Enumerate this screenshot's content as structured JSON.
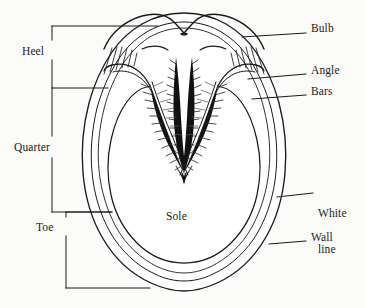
{
  "figure": {
    "background_color": "#fbfbf9",
    "ink_color": "#1b1b1b",
    "orientation": "heel at top, toe at bottom"
  },
  "labels": {
    "bulb": "Bulb",
    "angle": "Angle",
    "bars": "Bars",
    "white_line": "White\nline",
    "white_line_l1": "White",
    "white_line_l2": "line",
    "wall": "Wall",
    "sole": "Sole",
    "heel": "Heel",
    "quarter": "Quarter",
    "toe": "Toe"
  },
  "right_callouts": [
    {
      "name": "bulb",
      "label": "Bulb",
      "text_x": 311,
      "text_y": 29,
      "leader_from_x": 242,
      "leader_from_y": 37,
      "leader_to_x": 306,
      "leader_to_y": 33
    },
    {
      "name": "angle",
      "label": "Angle",
      "text_x": 311,
      "text_y": 70,
      "leader_from_x": 248,
      "leader_from_y": 79,
      "leader_to_x": 306,
      "leader_to_y": 74
    },
    {
      "name": "bars",
      "label": "Bars",
      "text_x": 311,
      "text_y": 91,
      "leader_from_x": 252,
      "leader_from_y": 99,
      "leader_to_x": 306,
      "leader_to_y": 95
    },
    {
      "name": "white-line",
      "label": "White line",
      "text_x": 318,
      "text_y": 189,
      "leader_from_x": 277,
      "leader_from_y": 197,
      "leader_to_x": 313,
      "leader_to_y": 193
    },
    {
      "name": "wall",
      "label": "Wall",
      "text_x": 311,
      "text_y": 237,
      "leader_from_x": 269,
      "leader_from_y": 244,
      "leader_to_x": 306,
      "leader_to_y": 241
    }
  ],
  "left_brackets": [
    {
      "name": "heel",
      "label": "Heel",
      "text_x": 22,
      "text_y": 52,
      "spine_x": 52,
      "top_y": 26,
      "bottom_y": 88,
      "arm_top_x": 158,
      "arm_bottom_x": 108
    },
    {
      "name": "quarter",
      "label": "Quarter",
      "text_x": 14,
      "text_y": 148,
      "spine_x": 52,
      "top_y": 88,
      "bottom_y": 212,
      "arm_top_x": 108,
      "arm_bottom_x": 112
    },
    {
      "name": "toe",
      "label": "Toe",
      "text_x": 36,
      "text_y": 228,
      "spine_x": 66,
      "top_y": 212,
      "bottom_y": 288,
      "arm_top_x": 112,
      "arm_bottom_x": 150
    }
  ],
  "inner_labels": [
    {
      "name": "sole",
      "label": "Sole",
      "text_x": 166,
      "text_y": 216
    }
  ],
  "anatomy_parts": [
    "Bulb",
    "Angle",
    "Bars",
    "White line",
    "Wall",
    "Sole",
    "Frog",
    "Heel",
    "Quarter",
    "Toe"
  ]
}
